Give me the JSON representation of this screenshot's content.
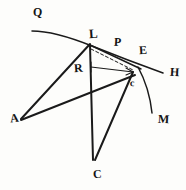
{
  "figure": {
    "kind": "hand-drawn-geometric-diagram",
    "width": 186,
    "height": 190,
    "background_color": "#fdfdfb",
    "ink_color": "#1a1a1a",
    "labels": [
      {
        "id": "Q",
        "text": "Q",
        "x": 33,
        "y": 6,
        "size": "sz-md",
        "skew": "skew-b"
      },
      {
        "id": "L",
        "text": "L",
        "x": 89,
        "y": 27,
        "size": "sz-lg",
        "skew": "skew-a"
      },
      {
        "id": "P",
        "text": "P",
        "x": 114,
        "y": 36,
        "size": "sz-md",
        "skew": "skew-b"
      },
      {
        "id": "E",
        "text": "E",
        "x": 139,
        "y": 44,
        "size": "sz-md",
        "skew": "skew-a"
      },
      {
        "id": "H",
        "text": "H",
        "x": 170,
        "y": 66,
        "size": "sz-md",
        "skew": "skew-b"
      },
      {
        "id": "R",
        "text": "R",
        "x": 74,
        "y": 62,
        "size": "sz-md",
        "skew": "skew-a"
      },
      {
        "id": "A",
        "text": "A",
        "x": 10,
        "y": 112,
        "size": "sz-md",
        "skew": "skew-c"
      },
      {
        "id": "c",
        "text": "c",
        "x": 130,
        "y": 78,
        "size": "sz-sm",
        "skew": "skew-b"
      },
      {
        "id": "M",
        "text": "M",
        "x": 158,
        "y": 113,
        "size": "sz-md",
        "skew": "skew-b"
      },
      {
        "id": "C",
        "text": "C",
        "x": 93,
        "y": 168,
        "size": "sz-md",
        "skew": "skew-a"
      }
    ],
    "strokes": [
      {
        "id": "arc-QLH",
        "name": "arc-through-q-l-h"
      },
      {
        "id": "arc-cM",
        "name": "arc-through-c-m"
      },
      {
        "id": "seg-AL",
        "name": "segment-a-to-l"
      },
      {
        "id": "seg-Ac",
        "name": "segment-a-to-c"
      },
      {
        "id": "seg-LC",
        "name": "segment-l-to-c"
      },
      {
        "id": "seg-cC",
        "name": "segment-c-to-c-lower"
      },
      {
        "id": "seg-LE",
        "name": "segment-l-to-e"
      },
      {
        "id": "seg-Lc",
        "name": "dashed-segment-l-to-c"
      },
      {
        "id": "seg-arrow",
        "name": "arrow-segment-r-to-c"
      }
    ]
  }
}
